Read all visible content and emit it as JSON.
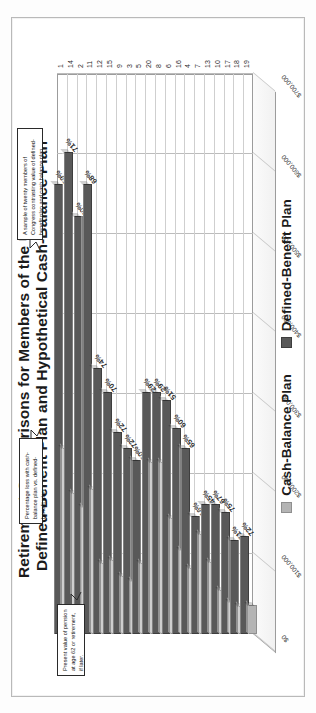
{
  "chart_data": {
    "type": "bar",
    "title": "Retirement Comparisons for Members of the U.S. Congress",
    "subtitle": "Defined-Benefit Plan and Hypothetical Cash-Balance Plan",
    "orientation": "horizontal",
    "xlabel": "",
    "ylabel": "",
    "grid": true,
    "legend_position": "bottom",
    "xlim": [
      0,
      700000
    ],
    "xticks": [
      "$0",
      "$100,000",
      "$200,000",
      "$300,000",
      "$400,000",
      "$500,000",
      "$600,000",
      "$700,000"
    ],
    "categories": [
      "1",
      "14",
      "2",
      "11",
      "12",
      "15",
      "9",
      "3",
      "5",
      "20",
      "8",
      "6",
      "16",
      "4",
      "7",
      "13",
      "10",
      "17",
      "18",
      "19"
    ],
    "series": [
      {
        "name": "Defined-Benefit Plan",
        "color": "#595959",
        "values": [
          560000,
          600000,
          520000,
          560000,
          330000,
          300000,
          250000,
          230000,
          215000,
          300000,
          300000,
          290000,
          255000,
          230000,
          145000,
          160000,
          160000,
          150000,
          115000,
          120000
        ]
      },
      {
        "name": "Cash-Balance Plan",
        "color": "#b4b4b4",
        "values": [
          230000,
          174000,
          156000,
          179000,
          86000,
          90000,
          70000,
          64000,
          86000,
          213000,
          213000,
          142000,
          102000,
          80000,
          122000,
          88000,
          53000,
          37000,
          33000,
          34000
        ]
      }
    ],
    "data_labels": [
      "59%",
      "71%",
      "70%",
      "68%",
      "74%",
      "70%",
      "72%",
      "72%",
      "60%",
      "29%",
      "29%",
      "51%",
      "60%",
      "65%",
      "16%",
      "45%",
      "67%",
      "75%",
      "71%",
      "72%"
    ],
    "data_label_note": "Percentage loss with cash-balance plan vs. defined-benefit plan"
  },
  "figure": {
    "title_line1": "Retirement Comparisons for Members of the U.S. Congress",
    "title_line2": "Defined-Benefit Plan and Hypothetical Cash-Balance Plan",
    "legend": [
      {
        "label": "Cash-Balance Plan",
        "color": "#b4b4b4"
      },
      {
        "label": "Defined-Benefit Plan",
        "color": "#595959"
      }
    ],
    "callouts": {
      "left": "Present value of pension at age 62 or retirement, if later.",
      "top": "Percentage loss with cash-balance plan vs. defined-benefit plan.",
      "right": "A sample of twenty members of Congress contrasting value of defined-benefit plan and cash balance plan."
    }
  }
}
